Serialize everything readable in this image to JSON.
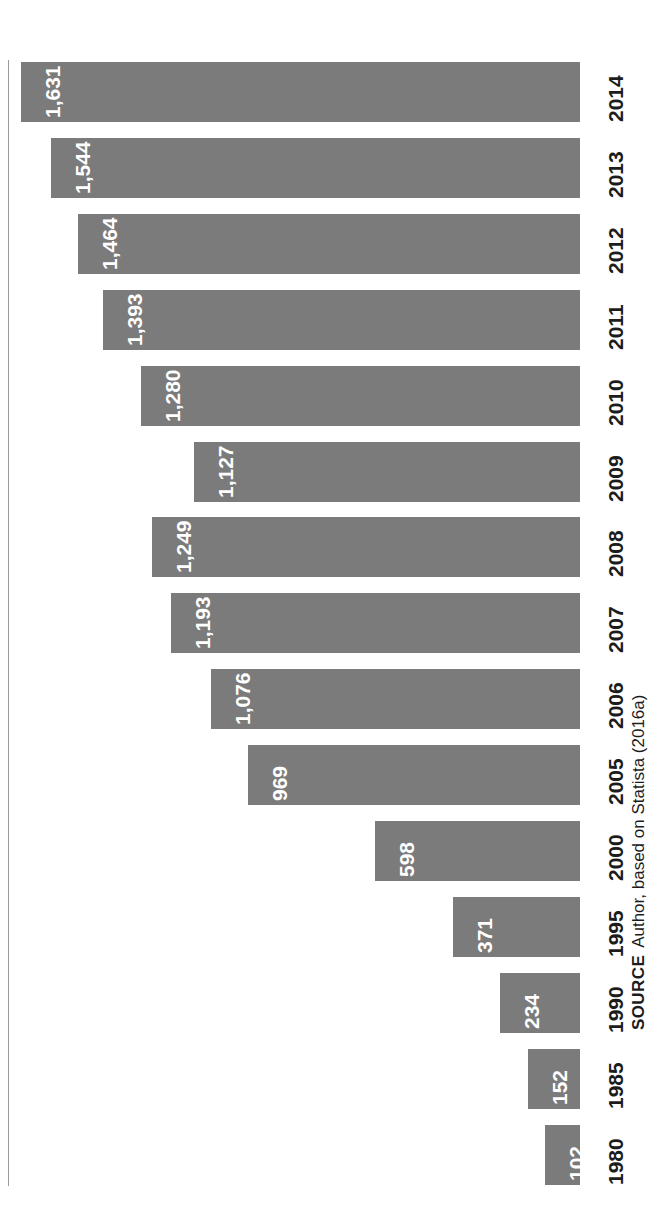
{
  "figure": {
    "orientation": "rotated-90-ccw",
    "bar_color": "#7b7b7b",
    "value_label_color": "#ffffff",
    "category_label_color": "#1c1c1c",
    "axis_line_color": "#9a9a9a"
  },
  "source": {
    "keyword": "SOURCE",
    "text": "Author, based on Statista (2016a)"
  },
  "chart_data": {
    "type": "bar",
    "title": "",
    "subtitle": "",
    "xlabel": "",
    "ylabel": "",
    "orientation": "horizontal",
    "grid": false,
    "legend": false,
    "axis_line": true,
    "value_labels_shown": true,
    "xlim": [
      0,
      1631
    ],
    "categories": [
      "2014",
      "2013",
      "2012",
      "2011",
      "2010",
      "2009",
      "2008",
      "2007",
      "2006",
      "2005",
      "2000",
      "1995",
      "1990",
      "1985",
      "1980"
    ],
    "values": [
      1631,
      1544,
      1464,
      1393,
      1280,
      1127,
      1249,
      1193,
      1076,
      969,
      598,
      371,
      234,
      152,
      102
    ],
    "value_labels": [
      "1,631",
      "1,544",
      "1,464",
      "1,393",
      "1,280",
      "1,127",
      "1,249",
      "1,193",
      "1,076",
      "969",
      "598",
      "371",
      "234",
      "152",
      "102"
    ]
  }
}
